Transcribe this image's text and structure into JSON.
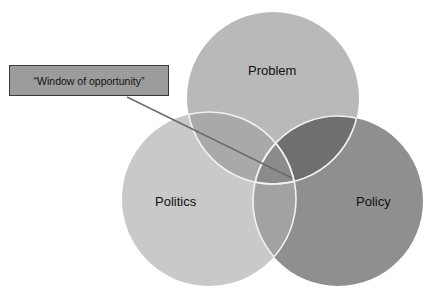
{
  "diagram": {
    "type": "venn",
    "title": "",
    "circles": [
      {
        "id": "problem",
        "label": "Problem",
        "cx": 273,
        "cy": 98,
        "r": 86,
        "fill": "#b9b9b9"
      },
      {
        "id": "politics",
        "label": "Politics",
        "cx": 209,
        "cy": 199,
        "r": 87,
        "fill": "#c9c9c9"
      },
      {
        "id": "policy",
        "label": "Policy",
        "cx": 338,
        "cy": 201,
        "r": 85,
        "fill": "#8f8f8f"
      }
    ],
    "overlaps": {
      "problem_politics": "#a9a9a9",
      "problem_policy": "#6f6f6f",
      "politics_policy": "#a2a2a2",
      "all_three": "#8b8b8b"
    },
    "outline_color": "#f2f2f2",
    "callout": {
      "text": "“Window of opportunity”",
      "box_fill": "#9c9c9c",
      "border_color": "#3a3a3a",
      "pointer_line": {
        "x1": 127,
        "y1": 97,
        "x2": 292,
        "y2": 178,
        "color": "#6a6a6a"
      }
    }
  }
}
